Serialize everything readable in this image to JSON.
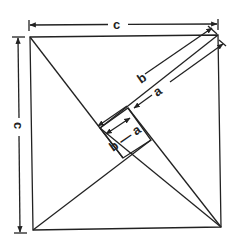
{
  "diagram": {
    "type": "pythagorean-square-proof",
    "stroke_color": "#222222",
    "background": "#ffffff",
    "labels": {
      "top_side": "c",
      "left_side": "c",
      "long_leg": "b",
      "short_leg": "a",
      "inner_square": "b — a"
    },
    "shapes": {
      "outer_square": "side c",
      "triangles": 4,
      "inner_square": "side b - a"
    }
  }
}
